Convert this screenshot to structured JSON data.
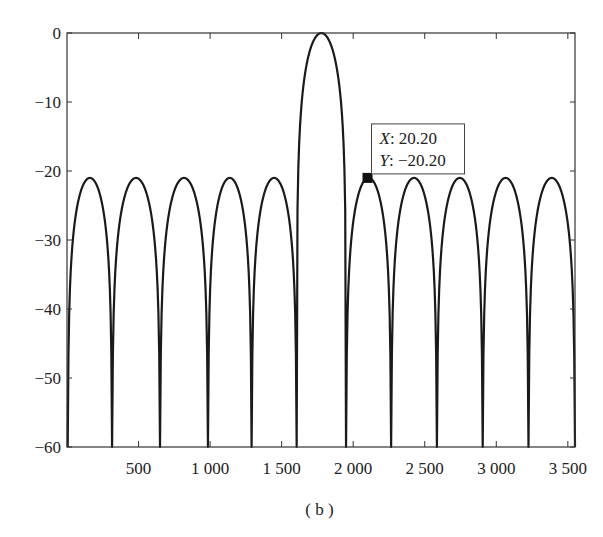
{
  "chart_data": {
    "type": "line",
    "title": "",
    "xlabel": "",
    "ylabel": "",
    "caption": "( b )",
    "xlim": [
      0,
      3550
    ],
    "ylim": [
      -60,
      0
    ],
    "grid": false,
    "legend": null,
    "x_ticks": [
      500,
      1000,
      1500,
      2000,
      2500,
      3000,
      3500
    ],
    "x_tick_labels": [
      "500",
      "1 000",
      "1 500",
      "2 000",
      "2 500",
      "3 000",
      "3 500"
    ],
    "y_ticks": [
      0,
      -10,
      -20,
      -30,
      -40,
      -50,
      -60
    ],
    "y_tick_labels": [
      "0",
      "−10",
      "−20",
      "−30",
      "−40",
      "−50",
      "−60"
    ],
    "main_lobe": {
      "x": 1775,
      "y": 0
    },
    "sidelobe_level": -21,
    "sidelobe_peaks_x": [
      160,
      480,
      815,
      1130,
      1445,
      2100,
      2420,
      2740,
      3060,
      3375
    ],
    "nulls_x": [
      315,
      650,
      985,
      1290,
      1605,
      1950,
      2265,
      2585,
      2905,
      3225,
      3550
    ],
    "start_value": {
      "x": 0,
      "y": -45
    },
    "series": [
      {
        "name": "pattern",
        "color": "#1a1a1a",
        "x": [
          0,
          160,
          315,
          650,
          985,
          1290,
          1605,
          1775,
          1950,
          2265,
          2585,
          2905,
          3225,
          3550
        ],
        "y": [
          -45,
          -21,
          -60,
          -60,
          -60,
          -60,
          -60,
          0,
          -60,
          -60,
          -60,
          -60,
          -60,
          -60
        ]
      }
    ],
    "datatip": {
      "marker_x": 2100,
      "marker_y": -21,
      "lines": [
        {
          "label": "X",
          "value": ": 20.20"
        },
        {
          "label": "Y",
          "value": ": −20.20"
        }
      ]
    }
  }
}
